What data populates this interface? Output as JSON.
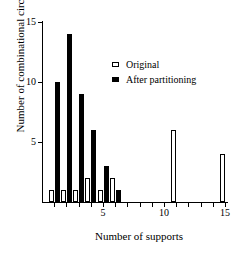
{
  "chart_data": {
    "type": "bar",
    "title": "",
    "subtitle": "",
    "xlabel": "Number of supports",
    "ylabel": "Number of combinational circuits",
    "xlim": [
      0,
      15.8
    ],
    "ylim": [
      0,
      15.2
    ],
    "grid": false,
    "legend_position": "upper-center-right",
    "x": [
      1,
      2,
      3,
      4,
      5,
      6,
      7,
      8,
      9,
      10,
      11,
      12,
      13,
      14,
      15
    ],
    "xticks": [
      1,
      2,
      3,
      4,
      5,
      6,
      7,
      8,
      9,
      10,
      11,
      12,
      13,
      14,
      15
    ],
    "xtick_labels_shown": [
      {
        "value": 5,
        "label": "5"
      },
      {
        "value": 10,
        "label": "10"
      },
      {
        "value": 15,
        "label": "15"
      }
    ],
    "yticks": [
      5,
      10,
      15
    ],
    "ytick_labels": [
      "5",
      "10",
      "15"
    ],
    "categories": [
      "1",
      "2",
      "3",
      "4",
      "5",
      "6",
      "7",
      "8",
      "9",
      "10",
      "11",
      "12",
      "13",
      "14",
      "15"
    ],
    "series": [
      {
        "name": "Original",
        "color": "#ffffff",
        "edge_color": "#000000",
        "values": [
          1,
          1,
          1,
          2,
          1,
          2,
          0,
          0,
          0,
          0,
          6,
          0,
          0,
          0,
          4
        ]
      },
      {
        "name": "After partitioning",
        "color": "#000000",
        "edge_color": "#000000",
        "values": [
          10,
          14,
          9,
          6,
          3,
          1,
          0,
          0,
          0,
          0,
          0,
          0,
          0,
          0,
          0
        ]
      }
    ]
  },
  "legend": {
    "items": [
      {
        "label": "Original",
        "style": "original"
      },
      {
        "label": "After partitioning",
        "style": "after"
      }
    ]
  },
  "axes": {
    "x_title": "Number of supports",
    "y_title": "Number of combinational circuits"
  }
}
